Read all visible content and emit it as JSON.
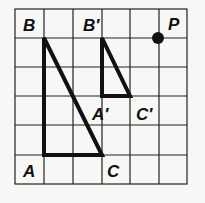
{
  "diagram": {
    "grid": {
      "x0": 15,
      "y0": 9,
      "cols": 6,
      "rows": 6,
      "cell_w": 28.67,
      "cell_h": 29.17,
      "line_color": "#222222"
    },
    "triangle_abc": {
      "vertices": {
        "A": [
          1,
          5
        ],
        "B": [
          1,
          1
        ],
        "C": [
          3,
          5
        ]
      },
      "labels": {
        "A": "A",
        "B": "B",
        "C": "C"
      }
    },
    "triangle_a1b1c1": {
      "vertices": {
        "A'": [
          3,
          3
        ],
        "B'": [
          3,
          1
        ],
        "C'": [
          4,
          3
        ]
      },
      "labels": {
        "A": "A′",
        "B": "B′",
        "C": "C′"
      }
    },
    "point_p": {
      "position": [
        5,
        1
      ],
      "label": "P"
    },
    "colors": {
      "stroke": "#111111",
      "background": "#f7f7f5"
    }
  }
}
